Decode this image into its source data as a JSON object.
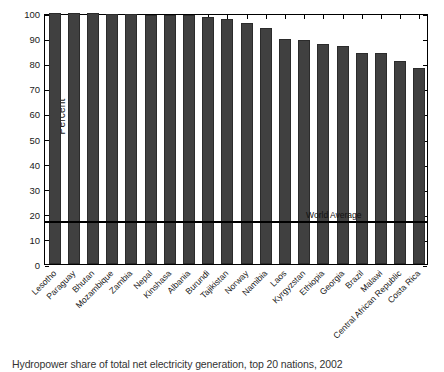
{
  "caption": "Hydropower share of total net electricity generation, top 20 nations, 2002",
  "colors": {
    "bar": "#404040",
    "bar_edge": "#2b2b2b",
    "axis": "#000000",
    "reference_line": "#000000",
    "background": "#ffffff"
  },
  "chart_data": {
    "type": "bar",
    "title": "",
    "xlabel": "",
    "ylabel": "Percent",
    "ylim": [
      0,
      100
    ],
    "yticks": [
      0,
      10,
      20,
      30,
      40,
      50,
      60,
      70,
      80,
      90,
      100
    ],
    "ytick_labels": [
      "0",
      "10",
      "20",
      "30",
      "40",
      "50",
      "60",
      "70",
      "80",
      "90",
      "100"
    ],
    "grid": false,
    "legend": null,
    "categories": [
      "Lesotho",
      "Paraguay",
      "Bhutan",
      "Mozambique",
      "Zambia",
      "Nepal",
      "Kinshasa",
      "Albania",
      "Burundi",
      "Tajikistan",
      "Norway",
      "Namibia",
      "Laos",
      "Kyrgyzstan",
      "Ethiopia",
      "Georgia",
      "Brazil",
      "Malawi",
      "Central African Republic",
      "Costa Rica"
    ],
    "values": [
      99.9,
      99.9,
      99.9,
      99.7,
      99.5,
      99.4,
      99.3,
      99.2,
      98.3,
      97.7,
      96.0,
      94.2,
      89.5,
      89.4,
      87.5,
      86.8,
      84.1,
      84.0,
      81.0,
      78.0
    ],
    "annotations": [
      {
        "name": "world-average",
        "label": "World Average",
        "value": 17.4,
        "orientation": "horizontal"
      }
    ]
  }
}
